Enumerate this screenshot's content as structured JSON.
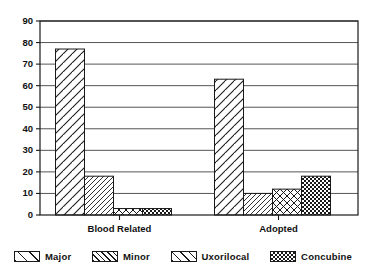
{
  "chart_data": {
    "type": "bar",
    "title": "",
    "subtitle": "",
    "xlabel": "",
    "ylabel": "",
    "categories": [
      "Blood Related",
      "Adopted"
    ],
    "series": [
      {
        "name": "Major",
        "pattern": "wide-diagonal-hatch",
        "values": [
          77,
          63
        ]
      },
      {
        "name": "Minor",
        "pattern": "narrow-diagonal-hatch",
        "values": [
          18,
          10
        ]
      },
      {
        "name": "Uxorilocal",
        "pattern": "cross-hatch",
        "values": [
          3,
          12
        ]
      },
      {
        "name": "Concubine",
        "pattern": "dense-checker",
        "values": [
          3,
          18
        ]
      }
    ],
    "ylim": [
      0,
      90
    ],
    "ytick_step": 10,
    "yticks": [
      0,
      10,
      20,
      30,
      40,
      50,
      60,
      70,
      80,
      90
    ],
    "ytick_labels": [
      "0",
      "10",
      "20",
      "30",
      "40",
      "50",
      "60",
      "70",
      "80",
      "90"
    ],
    "grid": true,
    "grid_axis": "y",
    "legend_position": "bottom",
    "bar_edge_color": "#1a1a1a",
    "grid_color": "#555555",
    "axis_color": "#1a1a1a",
    "background_color": "#ffffff"
  },
  "legend": {
    "items": [
      {
        "label": "Major"
      },
      {
        "label": "Minor"
      },
      {
        "label": "Uxorilocal"
      },
      {
        "label": "Concubine"
      }
    ]
  },
  "axis": {
    "x_categories": [
      {
        "label": "Blood Related"
      },
      {
        "label": "Adopted"
      }
    ]
  }
}
